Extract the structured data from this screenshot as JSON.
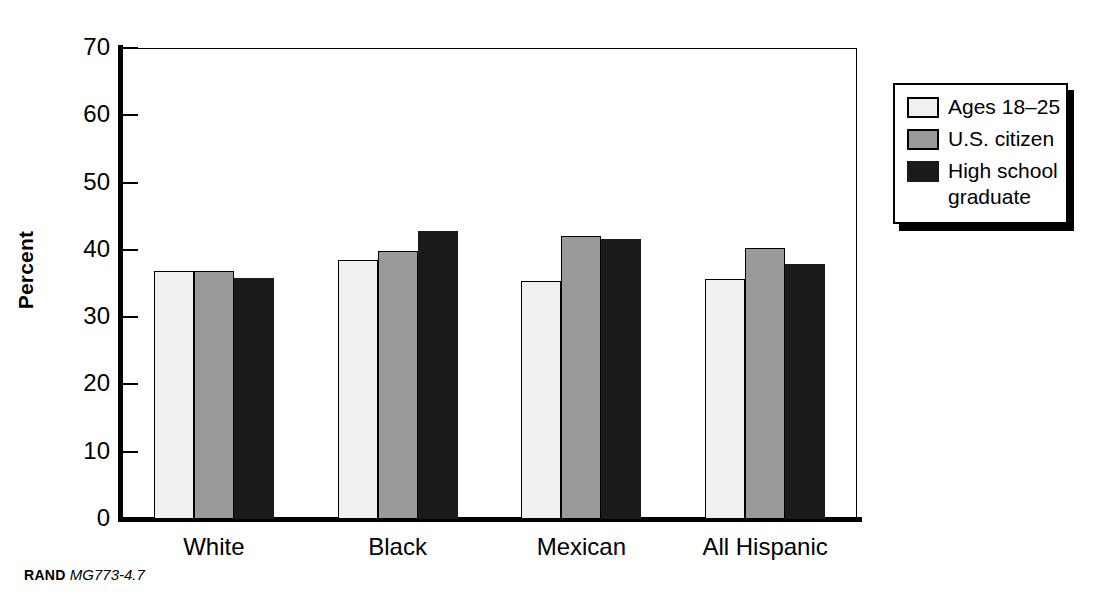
{
  "chart_data": {
    "type": "bar",
    "title": "",
    "xlabel": "",
    "ylabel": "Percent",
    "ylim": [
      0,
      70
    ],
    "yticks": [
      0,
      10,
      20,
      30,
      40,
      50,
      60,
      70
    ],
    "ytick_labels": [
      "0",
      "10",
      "20",
      "30",
      "40",
      "50",
      "60",
      "70"
    ],
    "grid": false,
    "legend_position": "right-outside",
    "categories": [
      "White",
      "Black",
      "Mexican",
      "All Hispanic"
    ],
    "series": [
      {
        "name": "Ages 18-25",
        "legend_label": "Ages 18–25",
        "color": "#f0f0f0",
        "values": [
          36.8,
          38.5,
          35.4,
          35.6
        ]
      },
      {
        "name": "U.S. citizen",
        "legend_label": "U.S. citizen",
        "color": "#9a9a9a",
        "values": [
          36.8,
          39.8,
          42.1,
          40.3
        ]
      },
      {
        "name": "High school graduate",
        "legend_label": "High school\ngraduate",
        "color": "#1a1a1a",
        "values": [
          35.8,
          42.8,
          41.6,
          37.9
        ]
      }
    ]
  },
  "footer": {
    "brand": "RAND",
    "figure_id": "MG773-4.7"
  }
}
